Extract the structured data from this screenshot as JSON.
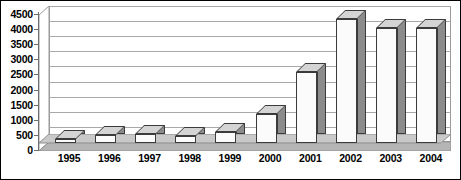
{
  "chart_data": {
    "type": "bar",
    "title": "",
    "subtitle": "",
    "xlabel": "",
    "ylabel": "",
    "categories": [
      "1995",
      "1996",
      "1997",
      "1998",
      "1999",
      "2000",
      "2001",
      "2002",
      "2003",
      "2004"
    ],
    "values": [
      120,
      280,
      290,
      230,
      350,
      950,
      2350,
      4100,
      3800,
      3820
    ],
    "series": [
      {
        "name": "",
        "values": [
          120,
          280,
          290,
          230,
          350,
          950,
          2350,
          4100,
          3800,
          3820
        ]
      }
    ],
    "ylim": [
      0,
      4500
    ],
    "ytick_step": 500,
    "yticks": [
      0,
      500,
      1000,
      1500,
      2000,
      2500,
      3000,
      3500,
      4000,
      4500
    ],
    "ytick_labels": [
      "0",
      "500",
      "1000",
      "1500",
      "2000",
      "2500",
      "3000",
      "3500",
      "4000",
      "4500"
    ],
    "grid": true,
    "grid_axis": "y",
    "legend": false,
    "legend_position": "none",
    "style_3d": true,
    "annotations": []
  },
  "style": {
    "bar_front_color": "#fbfbfb",
    "bar_side_color": "#8c8c8c",
    "bar_top_color": "#d4d4d4",
    "bar_edge_color": "#3b3b3b",
    "gridline_color": "#a8a8a8",
    "axis_color": "#6e6e6e",
    "floor_color": "#b5b5b5",
    "plot_background": "#ffffff",
    "figure_background": "#ffffff",
    "border_color": "#000000",
    "label_color": "#000000"
  }
}
